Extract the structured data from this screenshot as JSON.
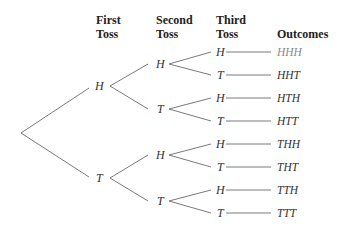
{
  "headers": {
    "first": "First\nToss",
    "second": "Second\nToss",
    "third": "Third\nToss",
    "outcomes": "Outcomes"
  },
  "first_toss": [
    "H",
    "T"
  ],
  "second_toss": [
    "H",
    "T",
    "H",
    "T"
  ],
  "third_toss": [
    "H",
    "T",
    "H",
    "T",
    "H",
    "T",
    "H",
    "T"
  ],
  "outcomes": [
    "HHH",
    "HHT",
    "HTH",
    "HTT",
    "THH",
    "THT",
    "TTH",
    "TTT"
  ],
  "colors": {
    "line": "#7a7a7a",
    "text": "#333333",
    "highlight_outcome": "#8a8a8a"
  }
}
